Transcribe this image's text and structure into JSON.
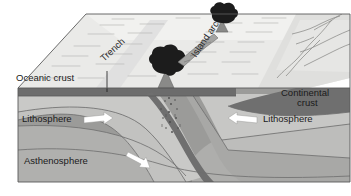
{
  "figure": {
    "kind": "geology-block-diagram",
    "background_color": "#ffffff",
    "frame_color": "#7d7d7d"
  },
  "labels": {
    "oceanic_crust": "Oceanic crust",
    "trench": "Trench",
    "island_arc": "Island arc",
    "continental_crust_line1": "Continental",
    "continental_crust_line2": "crust",
    "lithosphere_left": "Lithosphere",
    "lithosphere_right": "Lithosphere",
    "asthenosphere": "Asthenosphere"
  },
  "icons": {
    "volcano_front": "volcano-icon",
    "volcano_back": "volcano-icon",
    "arrow_left_plate": "arrow-right-icon",
    "arrow_right_plate": "arrow-left-icon",
    "arrow_mantle": "arrow-down-right-icon",
    "magma_plume": "magma-dots-icon",
    "leader_line": "leader-line-icon"
  },
  "colors": {
    "sea_surface": "#e8e8e6",
    "sea_surface_far": "#efefed",
    "land_surface": "#dcdcda",
    "oceanic_crust": "#6e6e6e",
    "continental_crust": "#6f6f6f",
    "lithosphere_upper": "#c9c9c7",
    "lithosphere_lower": "#b3b3b1",
    "slab": "#a6a6a4",
    "asthenosphere": "#9a9a98",
    "asthenosphere_deep": "#8d8d8b",
    "arrow_fill": "#ffffff",
    "volcano_dark": "#1c1c1c",
    "text": "#1a1a1a",
    "outline": "#5a5a5a"
  }
}
